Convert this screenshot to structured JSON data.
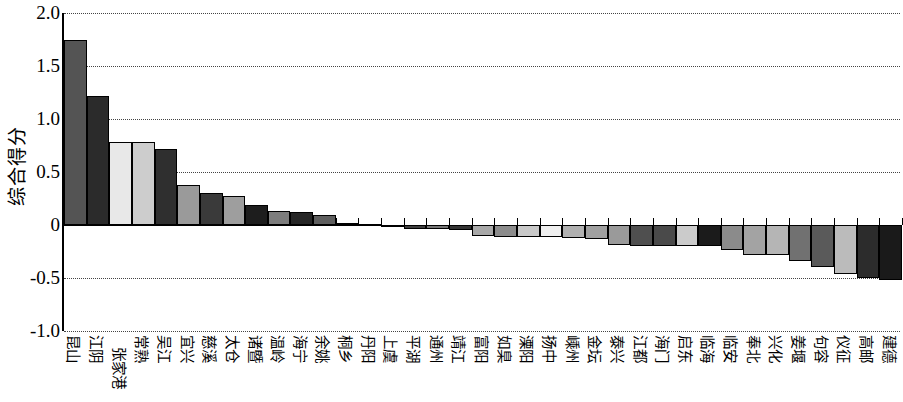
{
  "chart_data": {
    "type": "bar",
    "title": "",
    "xlabel": "",
    "ylabel": "综合得分",
    "ylim": [
      -1.0,
      2.0
    ],
    "yticks": [
      "2.0",
      "1.5",
      "1.0",
      "0.5",
      "0",
      "-0.5",
      "-1.0"
    ],
    "ytick_values": [
      2.0,
      1.5,
      1.0,
      0.5,
      0,
      -0.5,
      -1.0
    ],
    "grid": true,
    "grid_axis": "y",
    "grid_style": "dotted",
    "legend": "none",
    "orientation": "vertical",
    "bar_border_color": "#000000",
    "categories": [
      "昆山",
      "江阴",
      "张家港",
      "常熟",
      "吴江",
      "宜兴",
      "慈溪",
      "太仓",
      "诸暨",
      "温岭",
      "海宁",
      "余姚",
      "桐乡",
      "丹阳",
      "上虞",
      "平湖",
      "通州",
      "靖江",
      "富阳",
      "如臬",
      "溧阳",
      "扬中",
      "嵊州",
      "金坛",
      "泰兴",
      "江都",
      "海门",
      "启东",
      "临海",
      "临安",
      "奉北",
      "兴化",
      "姜堰",
      "句容",
      "仪征",
      "高邮",
      "建德"
    ],
    "values": [
      1.75,
      1.22,
      0.78,
      0.78,
      0.72,
      0.38,
      0.3,
      0.27,
      0.19,
      0.13,
      0.12,
      0.09,
      0.02,
      0.01,
      0.0,
      -0.04,
      -0.04,
      -0.05,
      -0.1,
      -0.11,
      -0.11,
      -0.11,
      -0.12,
      -0.13,
      -0.19,
      -0.2,
      -0.2,
      -0.2,
      -0.2,
      -0.24,
      -0.28,
      -0.28,
      -0.34,
      -0.4,
      -0.46,
      -0.5,
      -0.52
    ],
    "bar_colors": [
      "#545454",
      "#2b2b2b",
      "#e8e8e8",
      "#cdcdcd",
      "#2f2f2f",
      "#9a9a9a",
      "#3a3a3a",
      "#9e9e9e",
      "#1d1d1d",
      "#7d7d7d",
      "#262626",
      "#5e5e5e",
      "#d8d8d8",
      "#4a4a4a",
      "#8e8e8e",
      "#3f3f3f",
      "#777777",
      "#343434",
      "#a8a8a8",
      "#8c8c8c",
      "#c9c9c9",
      "#efefef",
      "#b0b0b0",
      "#a0a0a0",
      "#9a9a9a",
      "#4f4f4f",
      "#4a4a4a",
      "#cbcbcb",
      "#1b1b1b",
      "#8b8b8b",
      "#a3a3a3",
      "#b5b5b5",
      "#717171",
      "#5a5a5a",
      "#bbbbbb",
      "#2c2c2c",
      "#1a1a1a",
      "#111111",
      "#3a3a3a"
    ]
  }
}
